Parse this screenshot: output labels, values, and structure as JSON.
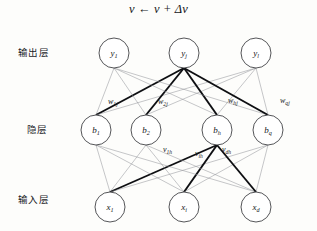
{
  "diagram": {
    "title_formula": "ν ← ν + Δν",
    "layer_labels": {
      "output": "输出层",
      "hidden": "隐层",
      "input": "输入层"
    },
    "output_nodes": [
      {
        "base": "y",
        "sub": "1"
      },
      {
        "base": "y",
        "sub": "j"
      },
      {
        "base": "y",
        "sub": "l"
      }
    ],
    "hidden_nodes": [
      {
        "base": "b",
        "sub": "1"
      },
      {
        "base": "b",
        "sub": "2"
      },
      {
        "base": "b",
        "sub": "h"
      },
      {
        "base": "b",
        "sub": "q"
      }
    ],
    "input_nodes": [
      {
        "base": "x",
        "sub": "1"
      },
      {
        "base": "x",
        "sub": "i"
      },
      {
        "base": "x",
        "sub": "d"
      }
    ],
    "hidden_to_output_weights": [
      {
        "base": "w",
        "sub": "1j"
      },
      {
        "base": "w",
        "sub": "2j"
      },
      {
        "base": "w",
        "sub": "hj"
      },
      {
        "base": "w",
        "sub": "qj"
      }
    ],
    "input_to_hidden_weights": [
      {
        "base": "v",
        "sub": "1h"
      },
      {
        "base": "v",
        "sub": "ih"
      },
      {
        "base": "v",
        "sub": "dh"
      }
    ],
    "colors": {
      "background": "#fdfdfb",
      "node_stroke": "#2a2b2f",
      "edge_light": "#8d8f95",
      "edge_bold": "#0e0f12",
      "text": "#15161a"
    }
  }
}
